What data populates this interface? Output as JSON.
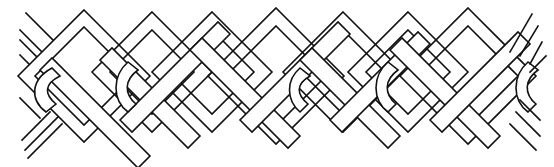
{
  "artwork": {
    "subject": "celtic-knotwork-border",
    "style": "black line drawing on white",
    "colors": {
      "background": "#ffffff",
      "line": "#111111"
    },
    "top_peaks_x": [
      84,
      152,
      212,
      276,
      343,
      408,
      468
    ],
    "bottom_valleys_x": [
      85,
      150,
      182,
      214,
      280,
      347,
      373,
      408,
      472
    ],
    "loop_arcs_x": [
      40,
      132,
      300,
      388,
      530
    ]
  }
}
